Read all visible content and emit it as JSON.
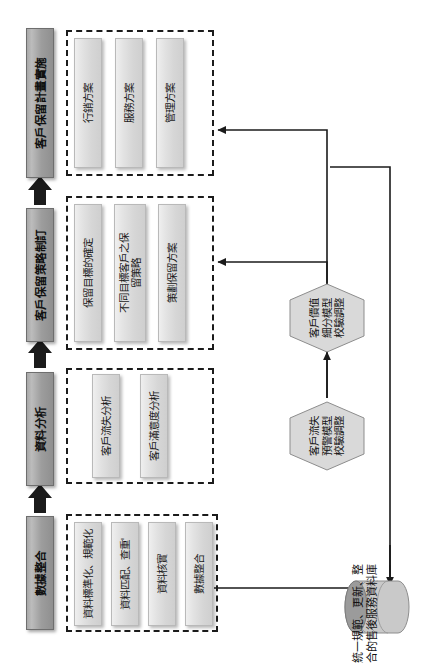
{
  "diagram": {
    "orientation": "rotated-90",
    "colors": {
      "stage_fill": "#a8a8a8",
      "stage_border": "#6e6e6e",
      "task_fill": "#e2e2e2",
      "task_border": "#b9b9b9",
      "group_border": "#1b1b1b",
      "hexagon_fill": "#d9d9d9",
      "cylinder_fill": "#b0b0b0",
      "connector": "#1b1b1b"
    },
    "stages": [
      {
        "id": "stage-implementation",
        "label": "客戶保留計畫實施"
      },
      {
        "id": "stage-strategy",
        "label": "客戶保留策略制訂"
      },
      {
        "id": "stage-analysis",
        "label": "資料分析"
      },
      {
        "id": "stage-integration",
        "label": "數據整合"
      }
    ],
    "groups": [
      {
        "id": "group-implementation",
        "stage": "客戶保留計畫實施",
        "tasks": [
          {
            "id": "task-marketing-plan",
            "label": "行銷方案"
          },
          {
            "id": "task-service-plan",
            "label": "服務方案"
          },
          {
            "id": "task-management-plan",
            "label": "管理方案"
          }
        ]
      },
      {
        "id": "group-strategy",
        "stage": "客戶保留策略制訂",
        "tasks": [
          {
            "id": "task-retention-goal",
            "label": "保留目標的確定"
          },
          {
            "id": "task-segment-strategy",
            "label": "不同目標客戶之保\n留策略"
          },
          {
            "id": "task-plan-retention",
            "label": "策劃保留方案"
          }
        ]
      },
      {
        "id": "group-analysis",
        "stage": "資料分析",
        "tasks": [
          {
            "id": "task-churn-analysis",
            "label": "客戶流失分析"
          },
          {
            "id": "task-satisfaction-analysis",
            "label": "客戶滿意度分析"
          }
        ]
      },
      {
        "id": "group-integration",
        "stage": "數據整合",
        "tasks": [
          {
            "id": "task-standardize",
            "label": "資料標準化、規範化"
          },
          {
            "id": "task-match-dedup",
            "label": "資料匹配、查重'"
          },
          {
            "id": "task-verify",
            "label": "資料核實"
          },
          {
            "id": "task-integrate",
            "label": "數據整合"
          }
        ]
      }
    ],
    "models": [
      {
        "id": "model-value-segmentation",
        "label": "客戶價值\n細分模型\n校驗調整"
      },
      {
        "id": "model-churn-warning",
        "label": "客戶流失\n預警模型\n校驗調整"
      }
    ],
    "database": {
      "id": "database-aftersales",
      "caption": "統一規範、更新、整\n合的售後服務資料庫"
    }
  }
}
